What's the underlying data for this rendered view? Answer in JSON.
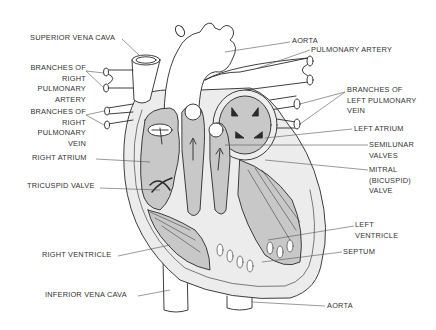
{
  "diagram": {
    "type": "anatomical-heart-cross-section",
    "colors": {
      "background": "#ffffff",
      "outline": "#2a2a2a",
      "chamber_fill": "#c8c8c8",
      "wall_fill": "#eeeeee",
      "label_text": "#333333"
    }
  },
  "labels": {
    "superior_vena_cava": "SUPERIOR VENA CAVA",
    "branches_right_pulmonary_artery": "BRANCHES OF\nRIGHT\nPULMONARY\nARTERY",
    "branches_right_pulmonary_vein": "BRANCHES OF\nRIGHT\nPULMONARY\nVEIN",
    "right_atrium": "RIGHT ATRIUM",
    "tricuspid_valve": "TRICUSPID VALVE",
    "right_ventricle": "RIGHT VENTRICLE",
    "inferior_vena_cava": "INFERIOR VENA CAVA",
    "aorta_top": "AORTA",
    "pulmonary_artery": "PULMONARY ARTERY",
    "branches_left_pulmonary_vein": "BRANCHES OF\nLEFT PULMONARY\nVEIN",
    "left_atrium": "LEFT ATRIUM",
    "semilunar_valves": "SEMILUNAR\nVALVES",
    "mitral_valve": "MITRAL\n(BICUSPID)\nVALVE",
    "left_ventricle": "LEFT\nVENTRICLE",
    "septum": "SEPTUM",
    "aorta_bottom": "AORTA"
  }
}
